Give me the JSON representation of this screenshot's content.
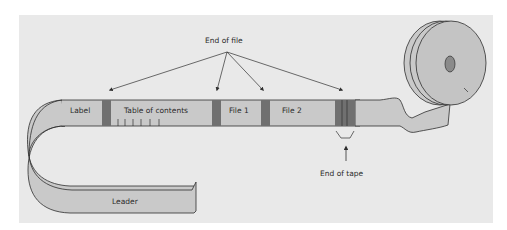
{
  "diagram": {
    "callouts": {
      "end_of_file": "End of file",
      "end_of_tape": "End of tape"
    },
    "segments": {
      "label": "Label",
      "table_of_contents": "Table of contents",
      "file1": "File 1",
      "file2": "File 2",
      "leader": "Leader"
    },
    "colors": {
      "background": "#e9e9e9",
      "tape": "#c9c9c9",
      "marker": "#707070",
      "outline": "#2f2f2f"
    }
  }
}
